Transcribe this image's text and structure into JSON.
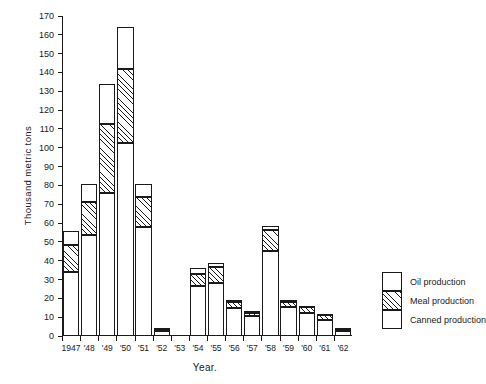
{
  "chart_data": {
    "type": "bar",
    "title": "",
    "subtitle": "",
    "xlabel": "Year.",
    "ylabel": "Thousand metric tons",
    "stacked": true,
    "grid": false,
    "legend_position": "right",
    "ylim": [
      0,
      170
    ],
    "ytick_step": 10,
    "yticks": [
      0,
      10,
      20,
      30,
      40,
      50,
      60,
      70,
      80,
      90,
      100,
      110,
      120,
      130,
      140,
      150,
      160,
      170
    ],
    "categories": [
      "1947",
      "'48",
      "'49",
      "'50",
      "'51",
      "'52",
      "'53",
      "'54",
      "'55",
      "'56",
      "'57",
      "'58",
      "'59",
      "'60",
      "'61",
      "'62"
    ],
    "series": [
      {
        "name": "Canned production",
        "pattern": "open",
        "values": [
          34,
          53.5,
          76,
          102.5,
          58,
          2.5,
          0,
          26.5,
          28,
          15,
          10.5,
          45,
          15.5,
          12,
          8.5,
          2.5
        ]
      },
      {
        "name": "Meal production",
        "pattern": "hatched",
        "values": [
          14.5,
          17.5,
          36.5,
          39.5,
          16,
          1,
          0,
          6.5,
          8.5,
          3,
          1.5,
          11.5,
          2.5,
          3.5,
          2.5,
          1.5
        ]
      },
      {
        "name": "Oil production",
        "pattern": "open",
        "values": [
          7.5,
          9.5,
          21.5,
          22,
          6.5,
          0.5,
          0,
          3,
          2.5,
          1,
          1.5,
          2,
          1,
          0.5,
          0.5,
          0.5
        ]
      }
    ],
    "totals": [
      56,
      80.5,
      134,
      164,
      80.5,
      4,
      0,
      36,
      39,
      19,
      13.5,
      58.5,
      19,
      16,
      11.5,
      4.5
    ]
  },
  "legend": {
    "entries": [
      {
        "label": "Oil production",
        "pattern": "open"
      },
      {
        "label": "Meal production",
        "pattern": "hatched"
      },
      {
        "label": "Canned production",
        "pattern": "open"
      }
    ]
  }
}
